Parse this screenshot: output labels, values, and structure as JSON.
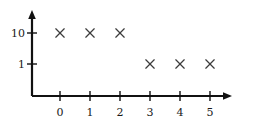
{
  "chart_data": {
    "type": "scatter",
    "title": "",
    "subtitle": "",
    "xlabel": "",
    "ylabel": "",
    "x": [
      0,
      1,
      2,
      3,
      4,
      5
    ],
    "values": [
      10,
      10,
      10,
      1,
      1,
      1
    ],
    "points": [
      {
        "x": 0,
        "y": 10
      },
      {
        "x": 1,
        "y": 10
      },
      {
        "x": 2,
        "y": 10
      },
      {
        "x": 3,
        "y": 1
      },
      {
        "x": 4,
        "y": 1
      },
      {
        "x": 5,
        "y": 1
      }
    ],
    "x_tick_labels": [
      "0",
      "1",
      "2",
      "3",
      "4",
      "5"
    ],
    "y_tick_labels": [
      "10",
      "1"
    ],
    "y_tick_values": [
      10,
      1
    ],
    "yscale": "log",
    "xlim": [
      -0.6,
      6.0
    ],
    "grid": false,
    "legend": null,
    "legend_position": "none",
    "marker": "x",
    "marker_color": "#3d3d3d",
    "axis_color": "#111111",
    "background_color": "#ffffff",
    "axis_style": "arrow-terminated"
  },
  "geometry": {
    "x_pixels": [
      60,
      90,
      120,
      150,
      180,
      210
    ],
    "y_pixel_10": 33,
    "y_pixel_1": 64,
    "axis_x_pixel": 32,
    "axis_y_pixel": 96
  }
}
